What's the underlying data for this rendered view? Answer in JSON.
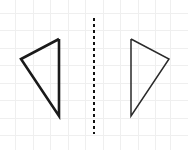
{
  "canvas": {
    "width": 188,
    "height": 150,
    "background": "#ffffff"
  },
  "grid": {
    "name": "graph-paper-grid",
    "line_color": "#efefef",
    "line_width": 1,
    "x_positions": [
      15,
      33,
      50,
      68,
      85,
      103,
      120,
      138,
      155,
      170
    ],
    "y_positions": [
      13,
      30,
      48,
      65,
      83,
      100,
      118,
      135
    ],
    "visible": true
  },
  "mirror_line": {
    "name": "line-of-reflection",
    "x": 94,
    "y_start": 18,
    "y_end": 134,
    "color": "#111111",
    "width": 2,
    "dash_on": 3,
    "dash_off": 3,
    "style": "dashed",
    "label": ""
  },
  "shapes": [
    {
      "name": "left-triangle",
      "role": "pre-image",
      "points": [
        [
          59,
          39
        ],
        [
          21,
          59
        ],
        [
          59,
          116
        ]
      ],
      "points_string": "59,39 21,59 59,116",
      "stroke": "#1a1a1a",
      "stroke_width": 2.6,
      "fill": "none",
      "vertex_labels": [
        "",
        "",
        ""
      ]
    },
    {
      "name": "right-triangle",
      "role": "image",
      "points": [
        [
          131,
          39
        ],
        [
          169,
          59
        ],
        [
          131,
          116
        ]
      ],
      "points_string": "131,39 169,59 131,116",
      "stroke": "#2a2a2a",
      "stroke_width": 1.5,
      "fill": "none",
      "vertex_labels": [
        "",
        "",
        ""
      ]
    }
  ],
  "chart_data": {
    "type": "scatter",
    "title": "",
    "xlabel": "",
    "ylabel": "",
    "grid": true,
    "legend": "none",
    "xlim": [
      0,
      188
    ],
    "ylim": [
      0,
      150
    ],
    "series": [
      {
        "name": "left-triangle",
        "x": [
          59,
          21,
          59,
          59
        ],
        "y": [
          39,
          59,
          116,
          39
        ]
      },
      {
        "name": "right-triangle",
        "x": [
          131,
          169,
          131,
          131
        ],
        "y": [
          39,
          59,
          116,
          39
        ]
      },
      {
        "name": "line-of-reflection",
        "x": [
          94,
          94
        ],
        "y": [
          18,
          134
        ]
      }
    ]
  }
}
